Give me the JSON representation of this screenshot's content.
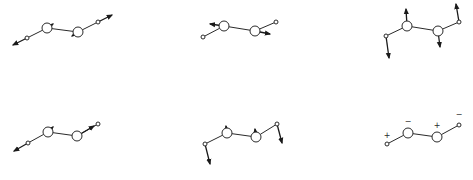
{
  "figure": {
    "modes": [
      {
        "id": "mode-1",
        "atoms": [
          {
            "x": 27,
            "y": 38,
            "r": 2
          },
          {
            "x": 47,
            "y": 28,
            "r": 5
          },
          {
            "x": 78,
            "y": 32,
            "r": 5
          },
          {
            "x": 98,
            "y": 22,
            "r": 2
          }
        ],
        "arrows": [
          {
            "x1": 27,
            "y1": 38,
            "x2": 13,
            "y2": 45
          },
          {
            "x1": 47,
            "y1": 28,
            "x2": 53,
            "y2": 24
          },
          {
            "x1": 78,
            "y1": 32,
            "x2": 72,
            "y2": 36
          },
          {
            "x1": 98,
            "y1": 22,
            "x2": 112,
            "y2": 15
          }
        ],
        "signs": []
      },
      {
        "id": "mode-2",
        "atoms": [
          {
            "x": 203,
            "y": 37,
            "r": 2
          },
          {
            "x": 224,
            "y": 26,
            "r": 5
          },
          {
            "x": 255,
            "y": 31,
            "r": 5
          },
          {
            "x": 276,
            "y": 22,
            "r": 2
          }
        ],
        "arrows": [
          {
            "x1": 224,
            "y1": 26,
            "x2": 210,
            "y2": 24
          },
          {
            "x1": 255,
            "y1": 31,
            "x2": 270,
            "y2": 34
          }
        ],
        "signs": []
      },
      {
        "id": "mode-3",
        "atoms": [
          {
            "x": 386,
            "y": 36,
            "r": 2
          },
          {
            "x": 407,
            "y": 26,
            "r": 5
          },
          {
            "x": 438,
            "y": 31,
            "r": 5
          },
          {
            "x": 459,
            "y": 22,
            "r": 2
          }
        ],
        "arrows": [
          {
            "x1": 386,
            "y1": 36,
            "x2": 389,
            "y2": 58
          },
          {
            "x1": 407,
            "y1": 26,
            "x2": 406,
            "y2": 9
          },
          {
            "x1": 438,
            "y1": 31,
            "x2": 440,
            "y2": 47
          },
          {
            "x1": 459,
            "y1": 22,
            "x2": 456,
            "y2": 4
          }
        ],
        "signs": []
      },
      {
        "id": "mode-4",
        "atoms": [
          {
            "x": 28,
            "y": 143,
            "r": 2
          },
          {
            "x": 48,
            "y": 132,
            "r": 5
          },
          {
            "x": 77,
            "y": 136,
            "r": 5
          },
          {
            "x": 98,
            "y": 124,
            "r": 2
          }
        ],
        "arrows": [
          {
            "x1": 28,
            "y1": 143,
            "x2": 14,
            "y2": 151
          },
          {
            "x1": 48,
            "y1": 132,
            "x2": 53,
            "y2": 127
          },
          {
            "x1": 77,
            "y1": 136,
            "x2": 94,
            "y2": 126
          }
        ],
        "signs": []
      },
      {
        "id": "mode-5",
        "atoms": [
          {
            "x": 205,
            "y": 144,
            "r": 2
          },
          {
            "x": 227,
            "y": 133,
            "r": 5
          },
          {
            "x": 256,
            "y": 137,
            "r": 5
          },
          {
            "x": 277,
            "y": 124,
            "r": 2
          }
        ],
        "arrows": [
          {
            "x1": 205,
            "y1": 144,
            "x2": 210,
            "y2": 164
          },
          {
            "x1": 227,
            "y1": 133,
            "x2": 226,
            "y2": 126
          },
          {
            "x1": 256,
            "y1": 137,
            "x2": 255,
            "y2": 129
          },
          {
            "x1": 277,
            "y1": 124,
            "x2": 282,
            "y2": 143
          }
        ],
        "signs": []
      },
      {
        "id": "mode-6",
        "atoms": [
          {
            "x": 387,
            "y": 144,
            "r": 2
          },
          {
            "x": 408,
            "y": 133,
            "r": 5
          },
          {
            "x": 437,
            "y": 137,
            "r": 5
          },
          {
            "x": 459,
            "y": 125,
            "r": 2
          }
        ],
        "arrows": [],
        "signs": [
          {
            "x": 387,
            "y": 138,
            "label": "+"
          },
          {
            "x": 408,
            "y": 124,
            "label": "−"
          },
          {
            "x": 437,
            "y": 128,
            "label": "+"
          },
          {
            "x": 459,
            "y": 117,
            "label": "−"
          }
        ]
      }
    ]
  }
}
